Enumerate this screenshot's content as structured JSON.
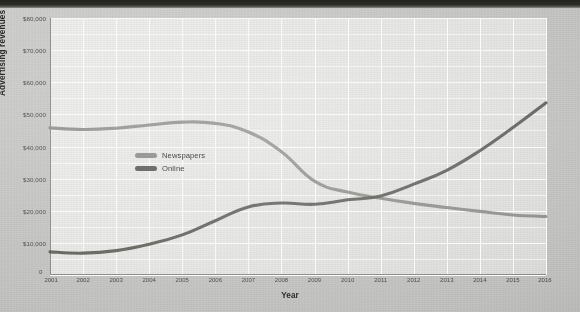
{
  "chart_data": {
    "type": "line",
    "title": "",
    "xlabel": "Year",
    "ylabel": "Advertising revenues in millions",
    "x": [
      2001,
      2002,
      2003,
      2004,
      2005,
      2006,
      2007,
      2008,
      2009,
      2010,
      2011,
      2012,
      2013,
      2014,
      2015,
      2016
    ],
    "xticklabels": [
      "2001",
      "2002",
      "2003",
      "2004",
      "2005",
      "2006",
      "2007",
      "2008",
      "2009",
      "2010",
      "2011",
      "2012",
      "2013",
      "2014",
      "2015",
      "2016"
    ],
    "ylim": [
      0,
      80000
    ],
    "yticks": [
      0,
      10000,
      20000,
      30000,
      40000,
      50000,
      60000,
      70000,
      80000
    ],
    "yticklabels": [
      "$10,000",
      "$20,000",
      "$30,000",
      "$40,000",
      "$50,000",
      "$60,000",
      "$70,000",
      "$80,000"
    ],
    "zero_label": "0",
    "y_minor_step": 5000,
    "grid": true,
    "grid_color": "#ffffff",
    "legend_position": "center-left",
    "series": [
      {
        "name": "Newspapers",
        "color": "#8c8c88",
        "values": [
          45800,
          45300,
          45700,
          46700,
          47600,
          47200,
          44500,
          38400,
          29200,
          25800,
          23900,
          22300,
          21000,
          19800,
          18700,
          18200
        ]
      },
      {
        "name": "Online",
        "color": "#595955",
        "values": [
          7200,
          6800,
          7600,
          9600,
          12500,
          16900,
          21200,
          22400,
          22000,
          23400,
          24600,
          28300,
          32600,
          38700,
          45900,
          53600
        ]
      }
    ]
  },
  "axis": {
    "ylabels": [
      {
        "value": 80000,
        "text": "$80,000"
      },
      {
        "value": 70000,
        "text": "$70,000"
      },
      {
        "value": 60000,
        "text": "$60,000"
      },
      {
        "value": 50000,
        "text": "$50,000"
      },
      {
        "value": 40000,
        "text": "$40,000"
      },
      {
        "value": 30000,
        "text": "$30,000"
      },
      {
        "value": 20000,
        "text": "$20,000"
      },
      {
        "value": 10000,
        "text": "$10,000"
      }
    ],
    "zero": "0",
    "ytitle": "Advertising revenues in millions",
    "xtitle": "Year"
  },
  "legend": {
    "items": [
      {
        "label": "Newspapers",
        "color": "#8c8c88"
      },
      {
        "label": "Online",
        "color": "#595955"
      }
    ]
  }
}
